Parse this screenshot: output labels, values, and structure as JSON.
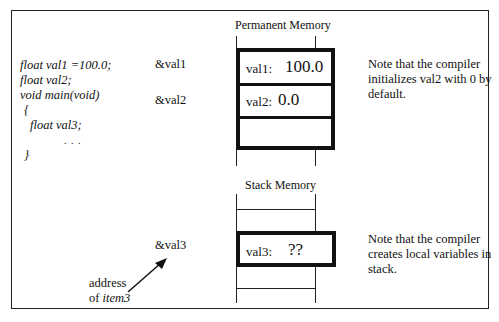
{
  "code": {
    "lines": [
      "float   val1 =100.0;",
      "float   val2;",
      "void  main(void)",
      "{",
      "float   val3;",
      ". . .",
      "}"
    ]
  },
  "permanent_memory": {
    "title": "Permanent Memory",
    "cells": [
      {
        "address": "&val1",
        "label": "val1:",
        "value": "100.0"
      },
      {
        "address": "&val2",
        "label": "val2:",
        "value": "0.0"
      },
      {
        "address": "",
        "label": "",
        "value": ""
      }
    ],
    "note": "Note that the compiler initializes val2 with 0 by default."
  },
  "stack_memory": {
    "title": "Stack Memory",
    "cell": {
      "address": "&val3",
      "label": "val3:",
      "value": "??"
    },
    "note": "Note that the compiler creates local variables in stack."
  },
  "pointer_label": {
    "line1": "address",
    "line2_prefix": "of ",
    "line2_italic": "item3"
  }
}
